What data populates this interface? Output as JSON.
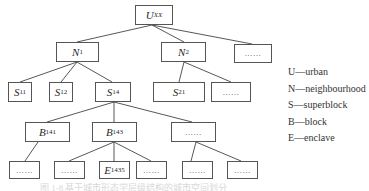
{
  "diagram": {
    "nodes": {
      "u": {
        "main": "U",
        "sub": "XX"
      },
      "n1": {
        "main": "N",
        "sub": "1"
      },
      "n2": {
        "main": "N",
        "sub": "2"
      },
      "l1_more": {
        "label": "……"
      },
      "s11": {
        "main": "S",
        "sub": "11"
      },
      "s12": {
        "main": "S",
        "sub": "12"
      },
      "s14": {
        "main": "S",
        "sub": "14"
      },
      "s21": {
        "main": "S",
        "sub": "21"
      },
      "l2_more": {
        "label": "……"
      },
      "b141": {
        "main": "B",
        "sub": "141"
      },
      "b143": {
        "main": "B",
        "sub": "143"
      },
      "l3_more": {
        "label": "……"
      },
      "l4_a": {
        "label": "……"
      },
      "l4_b": {
        "label": "……"
      },
      "e1435": {
        "main": "E",
        "sub": "1435"
      },
      "l4_c": {
        "label": "……"
      },
      "l4_d": {
        "label": "……"
      },
      "l4_e": {
        "label": "……"
      }
    },
    "edges": [
      [
        "u",
        "n1"
      ],
      [
        "u",
        "n2"
      ],
      [
        "u",
        "l1_more"
      ],
      [
        "n1",
        "s11"
      ],
      [
        "n1",
        "s12"
      ],
      [
        "n1",
        "s14"
      ],
      [
        "n2",
        "s21"
      ],
      [
        "n2",
        "l2_more"
      ],
      [
        "s14",
        "b141"
      ],
      [
        "s14",
        "b143"
      ],
      [
        "s14",
        "l3_more"
      ],
      [
        "b141",
        "l4_a"
      ],
      [
        "b143",
        "l4_b"
      ],
      [
        "b143",
        "e1435"
      ],
      [
        "b143",
        "l4_c"
      ],
      [
        "l3_more",
        "l4_d"
      ],
      [
        "l3_more",
        "l4_e"
      ]
    ]
  },
  "legend": {
    "items": [
      {
        "label": "U—urban"
      },
      {
        "label": "N—neighbourhood"
      },
      {
        "label": "S—superblock"
      },
      {
        "label": "B—block"
      },
      {
        "label": "E—enclave"
      }
    ]
  },
  "caption": "图 1-8  基于城市形态学层级结构的城市空间划分"
}
